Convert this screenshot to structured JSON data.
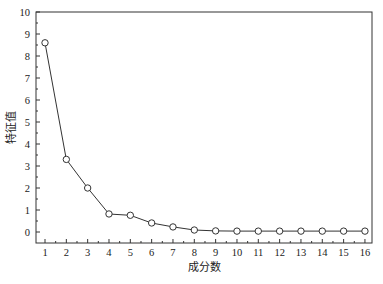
{
  "chart_data": {
    "type": "line",
    "title": "",
    "xlabel": "成分数",
    "ylabel": "特征值",
    "x": [
      1,
      2,
      3,
      4,
      5,
      6,
      7,
      8,
      9,
      10,
      11,
      12,
      13,
      14,
      15,
      16
    ],
    "series": [
      {
        "name": "特征值",
        "values": [
          8.6,
          3.3,
          2.0,
          0.82,
          0.76,
          0.41,
          0.23,
          0.09,
          0.05,
          0.04,
          0.04,
          0.04,
          0.04,
          0.04,
          0.04,
          0.04
        ],
        "marker": "open-circle",
        "color": "#333333"
      }
    ],
    "xlim": [
      0.5,
      16.5
    ],
    "ylim": [
      -0.5,
      10
    ],
    "xticks": [
      1,
      2,
      3,
      4,
      5,
      6,
      7,
      8,
      9,
      10,
      11,
      12,
      13,
      14,
      15,
      16
    ],
    "yticks": [
      0,
      1,
      2,
      3,
      4,
      5,
      6,
      7,
      8,
      9,
      10
    ],
    "grid": false,
    "legend": "none"
  }
}
